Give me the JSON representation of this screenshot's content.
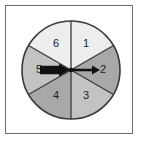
{
  "figure": {
    "name": "spinner-wheel",
    "title": "",
    "frame_color": "#6e6e6e",
    "background_color": "#ffffff"
  },
  "chart_data": {
    "type": "pie",
    "title": "",
    "xlabel": "",
    "ylabel": "",
    "categories": [
      "1",
      "2",
      "3",
      "4",
      "5",
      "6"
    ],
    "values": [
      1,
      1,
      1,
      1,
      1,
      1
    ],
    "equal_sectors": true,
    "sector_count": 6,
    "sector_angle_degrees": 60,
    "legend": "none",
    "grid": false,
    "annotations": [
      "arrow-left",
      "arrow-right"
    ]
  },
  "wheel": {
    "center_x": 71,
    "center_y": 70,
    "radius": 49,
    "outline_color": "#3a3a3a",
    "divider_color": "#3a3a3a",
    "sectors": [
      {
        "label": "1",
        "start_deg": -90,
        "end_deg": -30,
        "fill": "#ededed",
        "label_x": 86,
        "label_y": 44
      },
      {
        "label": "2",
        "start_deg": -30,
        "end_deg": 30,
        "fill": "#a8a8a8",
        "label_x": 103,
        "label_y": 70
      },
      {
        "label": "3",
        "start_deg": 30,
        "end_deg": 90,
        "fill": "#c3c3c3",
        "label_x": 86,
        "label_y": 96
      },
      {
        "label": "4",
        "start_deg": 90,
        "end_deg": 150,
        "fill": "#a8a8a8",
        "label_x": 56,
        "label_y": 96
      },
      {
        "label": "5",
        "start_deg": 150,
        "end_deg": 210,
        "fill": "#c3c3c3",
        "label_x": 39,
        "label_y": 70
      },
      {
        "label": "6",
        "start_deg": 210,
        "end_deg": 270,
        "fill": "#ededed",
        "label_x": 56,
        "label_y": 44
      }
    ]
  },
  "arrows": {
    "color": "#111111",
    "left": {
      "name": "arrow-left-pointing-right",
      "tail_x": 40,
      "tip_x": 70,
      "y": 70,
      "style": "thick-solid"
    },
    "right": {
      "name": "arrow-right-pointing-right",
      "tail_x": 72,
      "tip_x": 100,
      "y": 70,
      "style": "thin-line"
    }
  }
}
